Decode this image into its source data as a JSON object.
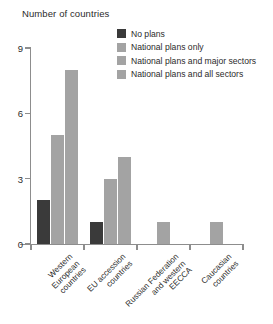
{
  "chart_data": {
    "type": "bar",
    "title": "Number of countries",
    "xlabel": "",
    "ylabel": "Number of countries",
    "ylim": [
      0,
      9
    ],
    "yticks": [
      0,
      3,
      6,
      9
    ],
    "grid": false,
    "legend_position": "top-right",
    "categories": [
      "Western European countries",
      "EU accession countries",
      "Russian Federation and western EECCA",
      "Caucasian countries"
    ],
    "category_labels": [
      "Western\nEuropean\ncountries",
      "EU accession\ncountries",
      "Russian Federation\nand western\nEECCA",
      "Caucasian\ncountries"
    ],
    "series": [
      {
        "name": "No plans",
        "color": "#3a3a3a",
        "values": [
          2,
          1,
          0,
          0
        ]
      },
      {
        "name": "National plans only",
        "color": "#a3a3a3",
        "values": [
          5,
          3,
          0,
          0
        ]
      },
      {
        "name": "National plans and major sectors",
        "color": "#a3a3a3",
        "values": [
          8,
          4,
          0,
          0
        ]
      },
      {
        "name": "National plans and all sectors",
        "color": "#a3a3a3",
        "values": [
          0,
          0,
          1,
          1
        ]
      }
    ]
  },
  "legend": {
    "items": [
      {
        "label": "No plans",
        "color": "#3a3a3a"
      },
      {
        "label": "National plans only",
        "color": "#a3a3a3"
      },
      {
        "label": "National plans and major sectors",
        "color": "#a3a3a3"
      },
      {
        "label": "National plans and all sectors",
        "color": "#a3a3a3"
      }
    ]
  },
  "axis": {
    "title": "Number of countries",
    "y_tick_labels": [
      "0",
      "3",
      "6",
      "9"
    ],
    "axis_color": "#8d8d8d"
  }
}
